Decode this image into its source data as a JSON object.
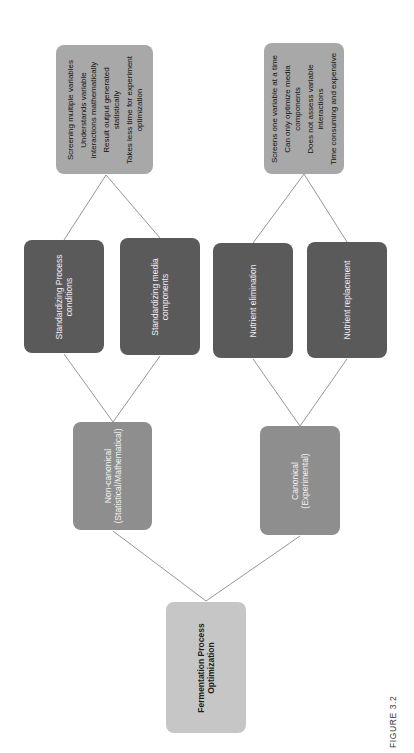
{
  "diagram": {
    "orientation": "rotated-90-ccw",
    "colors": {
      "root_fill": "#c6c6c6",
      "approach_fill": "#8e8e8e",
      "method_fill": "#5a5a5a",
      "summary_fill": "#a8a8a8",
      "connector": "#8a8a8a"
    },
    "root": {
      "lines": [
        "Fermentation Process",
        "Optimization"
      ]
    },
    "approaches": [
      {
        "id": "non-canonical",
        "lines": [
          "Non-canonical",
          "(Statistical/Mathematical)"
        ],
        "methods": [
          {
            "lines": [
              "Standardizing Process",
              "conditions"
            ]
          },
          {
            "lines": [
              "Standardizing media",
              "components"
            ]
          }
        ],
        "summary": {
          "items": [
            [
              "Screening multiple variables"
            ],
            [
              "Understands variable",
              "interactions mathematically"
            ],
            [
              "Result output generated",
              "statistically"
            ],
            [
              "Takes less time for experiment",
              "optimization"
            ]
          ]
        }
      },
      {
        "id": "canonical",
        "lines": [
          "Canonical",
          "(Experimental)"
        ],
        "methods": [
          {
            "lines": [
              "Nutrient elimination"
            ]
          },
          {
            "lines": [
              "Nutrient replacement"
            ]
          }
        ],
        "summary": {
          "items": [
            [
              "Screens one variable at a time"
            ],
            [
              "Can only optimize media",
              "components"
            ],
            [
              "Does not assess variable",
              "interactions"
            ],
            [
              "Time consuming and expensive"
            ]
          ]
        }
      }
    ]
  },
  "caption": "FIGURE 3.2"
}
